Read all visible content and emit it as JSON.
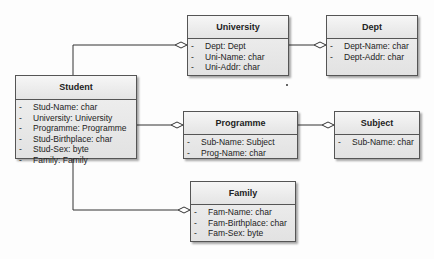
{
  "diagram": {
    "type": "UML class diagram",
    "classes": [
      {
        "id": "student",
        "name": "Student",
        "attributes": [
          {
            "visibility": "-",
            "text": "Stud-Name:  char"
          },
          {
            "visibility": "-",
            "text": "University:  University"
          },
          {
            "visibility": "-",
            "text": "Programme:  Programme"
          },
          {
            "visibility": "-",
            "text": "Stud-Birthplace:  char"
          },
          {
            "visibility": "-",
            "text": "Stud-Sex:  byte"
          },
          {
            "visibility": "-",
            "text": "Family:  Family"
          }
        ]
      },
      {
        "id": "university",
        "name": "University",
        "attributes": [
          {
            "visibility": "-",
            "text": "Dept:  Dept"
          },
          {
            "visibility": "-",
            "text": "Uni-Name:  char"
          },
          {
            "visibility": "-",
            "text": "Uni-Addr:  char"
          }
        ]
      },
      {
        "id": "dept",
        "name": "Dept",
        "attributes": [
          {
            "visibility": "-",
            "text": "Dept-Name:  char"
          },
          {
            "visibility": "-",
            "text": "Dept-Addr:  char"
          }
        ]
      },
      {
        "id": "programme",
        "name": "Programme",
        "attributes": [
          {
            "visibility": "-",
            "text": "Sub-Name:  Subject"
          },
          {
            "visibility": "-",
            "text": "Prog-Name:  char"
          }
        ]
      },
      {
        "id": "subject",
        "name": "Subject",
        "attributes": [
          {
            "visibility": "-",
            "text": "Sub-Name:  char"
          }
        ]
      },
      {
        "id": "family",
        "name": "Family",
        "attributes": [
          {
            "visibility": "-",
            "text": "Fam-Name:  char"
          },
          {
            "visibility": "-",
            "text": "Fam-Birthplace:  char"
          },
          {
            "visibility": "-",
            "text": "Fam-Sex:  byte"
          }
        ]
      }
    ],
    "relationships": [
      {
        "type": "aggregation",
        "whole": "university",
        "part": "student"
      },
      {
        "type": "aggregation",
        "whole": "programme",
        "part": "student"
      },
      {
        "type": "aggregation",
        "whole": "family",
        "part": "student"
      },
      {
        "type": "aggregation",
        "whole": "dept",
        "part": "university"
      },
      {
        "type": "aggregation",
        "whole": "subject",
        "part": "programme"
      }
    ]
  }
}
